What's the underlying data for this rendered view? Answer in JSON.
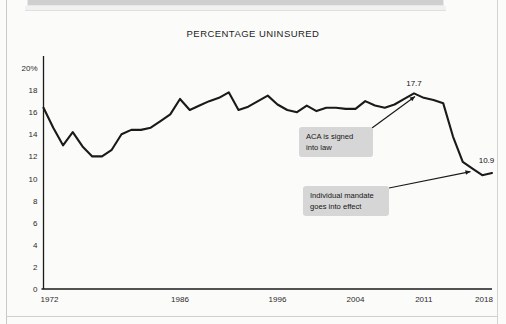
{
  "document": {
    "top_banner_present": true
  },
  "chart_data": {
    "type": "line",
    "title": "PERCENTAGE UNINSURED",
    "xlabel": "",
    "ylabel": "",
    "ylim": [
      0,
      20
    ],
    "xlim": [
      1972,
      2018
    ],
    "grid": false,
    "legend": "none",
    "y_ticks": [
      "0",
      "2",
      "4",
      "6",
      "8",
      "10",
      "12",
      "14",
      "16",
      "18",
      "20%"
    ],
    "y_tick_values": [
      0,
      2,
      4,
      6,
      8,
      10,
      12,
      14,
      16,
      18,
      20
    ],
    "x_ticks": [
      "1972",
      "1986",
      "1996",
      "2004",
      "2011",
      "2018"
    ],
    "x_tick_values": [
      1972,
      1986,
      1996,
      2004,
      2011,
      2018
    ],
    "series": [
      {
        "name": "Percentage uninsured",
        "color": "#1a1a1a",
        "x": [
          1972,
          1973,
          1974,
          1975,
          1976,
          1977,
          1978,
          1979,
          1980,
          1981,
          1982,
          1983,
          1984,
          1985,
          1986,
          1987,
          1988,
          1989,
          1990,
          1991,
          1992,
          1993,
          1994,
          1995,
          1996,
          1997,
          1998,
          1999,
          2000,
          2001,
          2002,
          2003,
          2004,
          2005,
          2006,
          2007,
          2008,
          2009,
          2010,
          2011,
          2012,
          2013,
          2014,
          2015,
          2016,
          2017,
          2018
        ],
        "values": [
          16.4,
          14.6,
          13.0,
          14.2,
          12.9,
          12.0,
          12.0,
          12.6,
          14.0,
          14.4,
          14.4,
          14.6,
          15.2,
          15.8,
          17.2,
          16.2,
          16.6,
          17.0,
          17.3,
          17.8,
          16.2,
          16.5,
          17.0,
          17.5,
          16.7,
          16.2,
          16.0,
          16.6,
          16.1,
          16.4,
          16.4,
          16.3,
          16.3,
          17.0,
          16.6,
          16.4,
          16.7,
          17.2,
          17.7,
          17.3,
          17.1,
          16.8,
          13.8,
          11.5,
          10.9,
          10.3,
          10.5
        ],
        "labeled_points": [
          {
            "x": 2010,
            "y": 17.7,
            "label": "17.7"
          },
          {
            "x": 2016,
            "y": 10.9,
            "label": "10.9"
          }
        ]
      }
    ],
    "annotations": [
      {
        "id": "aca",
        "lines": [
          "ACA is signed",
          "into law"
        ],
        "points_to": {
          "x": 2010,
          "y": 17.7
        }
      },
      {
        "id": "mandate",
        "lines": [
          "Individual mandate",
          "goes into effect"
        ],
        "points_to": {
          "x": 2016,
          "y": 10.9
        }
      }
    ],
    "colors": {
      "line": "#1a1a1a",
      "axis": "#1a1a1a",
      "annotation_background": "#d6d6d6",
      "text": "#1d1d1d",
      "page_background": "#fbfbfa"
    }
  }
}
